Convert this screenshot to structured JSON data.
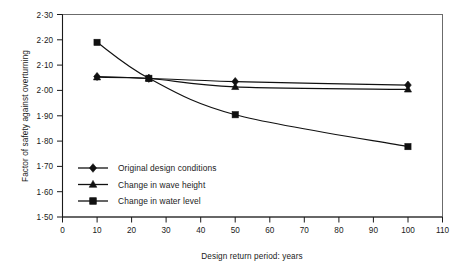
{
  "chart_data": {
    "type": "line",
    "title": "",
    "xlabel": "Design return period: years",
    "ylabel": "Factor of safety against overturning",
    "x": [
      10,
      25,
      50,
      100
    ],
    "xlim": [
      0,
      110
    ],
    "ylim": [
      1.5,
      2.3
    ],
    "xticks": [
      0,
      10,
      20,
      30,
      40,
      50,
      60,
      70,
      80,
      90,
      100,
      110
    ],
    "xtick_labels": [
      "0",
      "10",
      "20",
      "30",
      "40",
      "50",
      "60",
      "70",
      "80",
      "90",
      "100",
      "110"
    ],
    "yticks": [
      1.5,
      1.6,
      1.7,
      1.8,
      1.9,
      2.0,
      2.1,
      2.2,
      2.3
    ],
    "ytick_labels": [
      "1·50",
      "1·60",
      "1·70",
      "1·80",
      "1·90",
      "2·00",
      "2·10",
      "2·20",
      "2·30"
    ],
    "grid": false,
    "legend_position": "center-left-inside",
    "series": [
      {
        "name": "Original design conditions",
        "marker": "diamond",
        "color": "#111111",
        "values": [
          2.055,
          2.048,
          2.035,
          2.021
        ]
      },
      {
        "name": "Change in wave height",
        "marker": "triangle",
        "color": "#111111",
        "values": [
          2.052,
          2.047,
          2.014,
          2.004
        ]
      },
      {
        "name": "Change in water level",
        "marker": "square",
        "color": "#111111",
        "values": [
          2.19,
          2.048,
          1.904,
          1.778
        ]
      }
    ]
  },
  "legend": {
    "entries": [
      {
        "label": "Original design conditions",
        "marker": "diamond"
      },
      {
        "label": "Change in wave height",
        "marker": "triangle"
      },
      {
        "label": "Change in water level",
        "marker": "square"
      }
    ]
  },
  "colors": {
    "ink": "#111111",
    "frame": "#5c5c5c",
    "background": "#ffffff"
  }
}
